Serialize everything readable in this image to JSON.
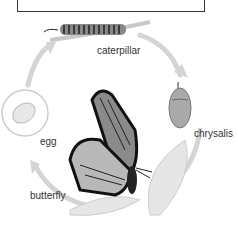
{
  "diagram": {
    "title_box": "",
    "stages": [
      {
        "id": "caterpillar",
        "label": "caterpillar"
      },
      {
        "id": "chrysalis",
        "label": "chrysalis"
      },
      {
        "id": "butterfly",
        "label": "butterfly"
      },
      {
        "id": "egg",
        "label": "egg"
      }
    ],
    "arrow_color": "#d0d0d0"
  }
}
